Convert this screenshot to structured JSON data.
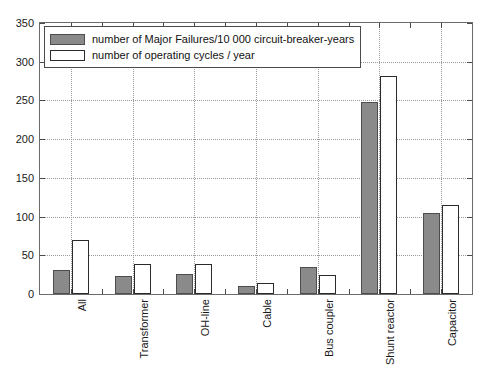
{
  "chart_data": {
    "type": "bar",
    "title": "",
    "subtitle": "",
    "xlabel": "",
    "ylabel": "",
    "ylim": [
      0,
      350
    ],
    "ytick_labels": [
      "0",
      "50",
      "100",
      "150",
      "200",
      "250",
      "300",
      "350"
    ],
    "ytick_values": [
      0,
      50,
      100,
      150,
      200,
      250,
      300,
      350
    ],
    "grid": true,
    "legend_position": "upper-left",
    "categories": [
      "All",
      "Transformer",
      "OH-line",
      "Cable",
      "Bus coupler",
      "Shunt reactor",
      "Capacitor"
    ],
    "series": [
      {
        "name": "number of Major Failures/10 000 circuit-breaker-years",
        "color": "#8a8a8a",
        "edge_color": "#4d4d4d",
        "values": [
          31,
          23,
          26,
          10,
          35,
          248,
          105
        ]
      },
      {
        "name": "number of operating cycles / year",
        "color": "#ffffff",
        "edge_color": "#2b2b2b",
        "values": [
          70,
          39,
          39,
          14,
          24,
          281,
          115
        ]
      }
    ]
  },
  "figure": {
    "background": "#ffffff",
    "frame_color": "#6b6b6b",
    "grid_color": "#9a9a9a"
  }
}
